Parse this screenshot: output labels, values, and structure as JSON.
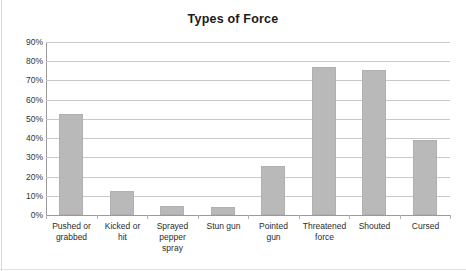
{
  "chart_data": {
    "type": "bar",
    "title": "Types of Force",
    "xlabel": "",
    "ylabel": "",
    "ylim": [
      0,
      90
    ],
    "grid": true,
    "legend": false,
    "legend_position": "none",
    "bar_color": "#b9b9b9",
    "ytick_labels": [
      "90%",
      "80%",
      "70%",
      "60%",
      "50%",
      "40%",
      "30%",
      "20%",
      "10%",
      "0%"
    ],
    "ytick_values": [
      90,
      80,
      70,
      60,
      50,
      40,
      30,
      20,
      10,
      0
    ],
    "categories": [
      "Pushed or grabbed",
      "Kicked or hit",
      "Sprayed pepper spray",
      "Stun gun",
      "Pointed gun",
      "Threatened force",
      "Shouted",
      "Cursed"
    ],
    "category_lines": [
      [
        "Pushed or",
        "grabbed"
      ],
      [
        "Kicked or",
        "hit"
      ],
      [
        "Sprayed",
        "pepper",
        "spray"
      ],
      [
        "Stun gun"
      ],
      [
        "Pointed",
        "gun"
      ],
      [
        "Threatened",
        "force"
      ],
      [
        "Shouted"
      ],
      [
        "Cursed"
      ]
    ],
    "values": [
      52.5,
      12.3,
      4.8,
      4.0,
      25.5,
      77.0,
      75.5,
      39.2
    ]
  }
}
